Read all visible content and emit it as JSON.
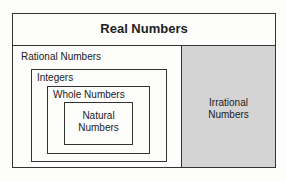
{
  "diagram": {
    "title": "Real Numbers",
    "sets": {
      "rational": "Rational Numbers",
      "integers": "Integers",
      "whole": "Whole Numbers",
      "natural": "Natural Numbers",
      "irrational": "Irrational Numbers"
    },
    "colors": {
      "irrational_fill": "#d4d4d4",
      "border": "#333333"
    }
  }
}
